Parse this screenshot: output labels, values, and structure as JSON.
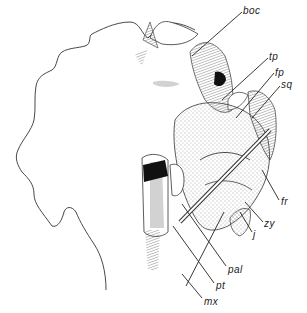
{
  "figure": {
    "labels": [
      {
        "id": "boc",
        "text": "boc",
        "x": 243,
        "y": 6
      },
      {
        "id": "tp",
        "text": "tp",
        "x": 269,
        "y": 52
      },
      {
        "id": "fp",
        "text": "fp",
        "x": 275,
        "y": 68
      },
      {
        "id": "sq",
        "text": "sq",
        "x": 281,
        "y": 80
      },
      {
        "id": "fr",
        "text": "fr",
        "x": 281,
        "y": 197
      },
      {
        "id": "zy",
        "text": "zy",
        "x": 264,
        "y": 219
      },
      {
        "id": "j",
        "text": "j",
        "x": 253,
        "y": 230
      },
      {
        "id": "pal",
        "text": "pal",
        "x": 228,
        "y": 265
      },
      {
        "id": "pt",
        "text": "pt",
        "x": 216,
        "y": 281
      },
      {
        "id": "mx",
        "text": "mx",
        "x": 204,
        "y": 297
      }
    ]
  }
}
